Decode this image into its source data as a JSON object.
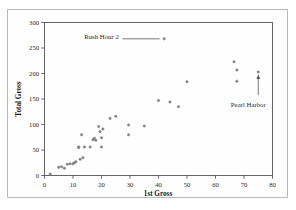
{
  "chart_data": {
    "type": "scatter",
    "title": "",
    "xlabel": "1st Gross",
    "ylabel": "Total Gross",
    "xlim": [
      0,
      80
    ],
    "ylim": [
      0,
      300
    ],
    "xticks": [
      0,
      10,
      20,
      30,
      40,
      50,
      60,
      70,
      80
    ],
    "yticks": [
      0,
      50,
      100,
      150,
      200,
      250,
      300
    ],
    "xtick_labels": [
      "0",
      "10",
      "20",
      "30",
      "40",
      "50",
      "60",
      "70",
      "80"
    ],
    "ytick_labels": [
      "0",
      "50",
      "100",
      "150",
      "200",
      "250",
      "300"
    ],
    "grid": false,
    "legend": null,
    "series": [
      {
        "name": "Movies",
        "marker": "dot",
        "color": "#8a8a8a",
        "x": [
          2,
          5,
          6,
          7,
          8,
          9,
          10,
          10.5,
          11,
          12,
          12.5,
          13,
          13.5,
          12,
          14,
          16,
          17,
          17.5,
          18,
          19,
          19.5,
          20,
          20,
          20.5,
          23,
          25,
          29.5,
          29.5,
          35,
          40,
          42,
          44,
          47,
          50,
          66.5,
          67.5,
          67.5,
          75
        ],
        "y": [
          3,
          16,
          17,
          14,
          22,
          23,
          23,
          25,
          27,
          55,
          32,
          80,
          35,
          56,
          56,
          56,
          70,
          73,
          69,
          96,
          86,
          74,
          56,
          91,
          112,
          116,
          80,
          99,
          97,
          147,
          268,
          144,
          135,
          184,
          223,
          207,
          185,
          203
        ]
      }
    ],
    "annotations": [
      {
        "label": "Rush Hour 2",
        "point_x": 42,
        "point_y": 268,
        "label_x": 20,
        "label_y": 272,
        "connector": "line"
      },
      {
        "label": "Pearl Harbor",
        "point_x": 75,
        "point_y": 203,
        "label_x": 68,
        "label_y": 140,
        "connector": "arrow"
      }
    ]
  },
  "figure": {
    "axis_color": "#555555",
    "point_color": "#8a8a8a",
    "background": "#ffffff"
  }
}
